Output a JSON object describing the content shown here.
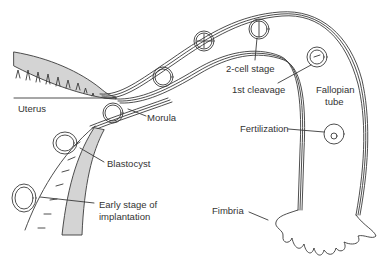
{
  "diagram": {
    "colors": {
      "line": "#3a3a3a",
      "wall_fill": "#d4d4d4",
      "text": "#333333",
      "background": "#ffffff"
    },
    "labels": {
      "uterus": "Uterus",
      "morula": "Morula",
      "blastocyst": "Blastocyst",
      "early_implantation_line1": "Early stage of",
      "early_implantation_line2": "implantation",
      "two_cell": "2-cell stage",
      "first_cleavage": "1st cleavage",
      "fallopian_line1": "Fallopian",
      "fallopian_line2": "tube",
      "fertilization": "Fertilization",
      "fimbria": "Fimbria"
    }
  }
}
